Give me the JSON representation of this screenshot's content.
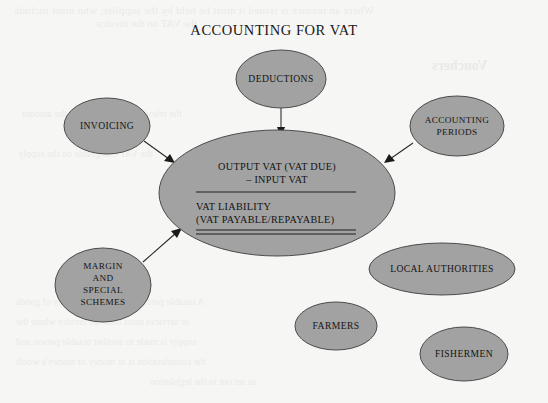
{
  "page": {
    "title": "ACCOUNTING FOR VAT",
    "background_color": "#f6f6f4",
    "node_fill_color": "#a2a2a2",
    "node_stroke_color": "#4b4b4b",
    "text_color": "#141414"
  },
  "center_node": {
    "name": "vat-liability-formula",
    "numerator_line1": "OUTPUT VAT (VAT DUE)",
    "numerator_line2": "– INPUT VAT",
    "result_line1": "VAT LIABILITY",
    "result_line2": "(VAT PAYABLE/REPAYABLE)",
    "has_single_rule": true,
    "has_double_rule": true
  },
  "nodes": [
    {
      "name": "deductions",
      "lines": [
        "DEDUCTIONS"
      ],
      "connected": true
    },
    {
      "name": "invoicing",
      "lines": [
        "INVOICING"
      ],
      "connected": true
    },
    {
      "name": "accounting-periods",
      "lines": [
        "ACCOUNTING",
        "PERIODS"
      ],
      "connected": true
    },
    {
      "name": "margin-and-special-schemes",
      "lines": [
        "MARGIN",
        "AND",
        "SPECIAL",
        "SCHEMES"
      ],
      "connected": true
    },
    {
      "name": "local-authorities",
      "lines": [
        "LOCAL AUTHORITIES"
      ],
      "connected": false
    },
    {
      "name": "farmers",
      "lines": [
        "FARMERS"
      ],
      "connected": false
    },
    {
      "name": "fishermen",
      "lines": [
        "FISHERMEN"
      ],
      "connected": false
    }
  ],
  "connectors": [
    {
      "name": "connector-deductions-to-center",
      "from": "deductions",
      "to": "center_node",
      "direction": "down"
    },
    {
      "name": "connector-invoicing-to-center",
      "from": "invoicing",
      "to": "center_node",
      "direction": "down-right"
    },
    {
      "name": "connector-accounting-periods-to-center",
      "from": "accounting-periods",
      "to": "center_node",
      "direction": "down-left"
    },
    {
      "name": "connector-margin-schemes-to-center",
      "from": "margin-and-special-schemes",
      "to": "center_node",
      "direction": "up-right"
    }
  ],
  "bleed_through": {
    "line1": "Where an invoice is issued it must be held by the supplier, who must include",
    "line2": "the VAT on the invoice",
    "line3": "Vouchers",
    "line4": "the relevant VAT period and the amount",
    "line5": "the VAT chargeable on the supply",
    "line6": "A taxable person who makes a supply of goods",
    "line7": "or services must issue an invoice where the",
    "line8": "supply is made to another taxable person and",
    "line9": "the consideration is in money or money's worth",
    "line10": "as set out in the legislation"
  }
}
